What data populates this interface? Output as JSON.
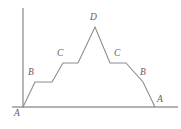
{
  "figure": {
    "kind": "line-diagram",
    "colors": {
      "background": "#ffffff",
      "axis": "#9a9a9a",
      "profile": "#8c8c8c",
      "label": "#5f5f5f"
    },
    "axes": {
      "vertical": {
        "x": 23,
        "y_top": 8,
        "y_bottom": 108
      },
      "horizontal": {
        "y": 107,
        "x_left": 12,
        "x_right": 178
      }
    },
    "profile_points": [
      {
        "x": 23,
        "y": 107
      },
      {
        "x": 35,
        "y": 82
      },
      {
        "x": 52,
        "y": 82
      },
      {
        "x": 63,
        "y": 63
      },
      {
        "x": 78,
        "y": 63
      },
      {
        "x": 95,
        "y": 27
      },
      {
        "x": 110,
        "y": 63
      },
      {
        "x": 126,
        "y": 63
      },
      {
        "x": 143,
        "y": 82
      },
      {
        "x": 155,
        "y": 107
      }
    ],
    "labels": [
      {
        "text": "A",
        "x": 14,
        "y": 109,
        "name": "vertex-label-a-left"
      },
      {
        "text": "B",
        "x": 28,
        "y": 68,
        "name": "vertex-label-b-left"
      },
      {
        "text": "C",
        "x": 57,
        "y": 49,
        "name": "vertex-label-c-left"
      },
      {
        "text": "D",
        "x": 90,
        "y": 13,
        "name": "vertex-label-d-peak"
      },
      {
        "text": "C",
        "x": 114,
        "y": 49,
        "name": "vertex-label-c-right"
      },
      {
        "text": "B",
        "x": 140,
        "y": 68,
        "name": "vertex-label-b-right"
      },
      {
        "text": "A",
        "x": 157,
        "y": 95,
        "name": "vertex-label-a-right"
      }
    ]
  }
}
